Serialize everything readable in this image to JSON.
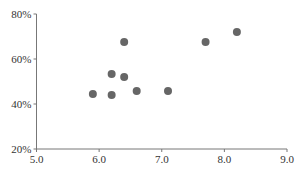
{
  "chart_data": {
    "type": "scatter",
    "title": "",
    "xlabel": "",
    "ylabel": "",
    "xlim": [
      5.0,
      9.0
    ],
    "ylim": [
      20,
      80
    ],
    "x_ticks": [
      "5.0",
      "6.0",
      "7.0",
      "8.0",
      "9.0"
    ],
    "y_ticks": [
      "20%",
      "40%",
      "60%",
      "80%"
    ],
    "grid": false,
    "legend": null,
    "point_color": "#666666",
    "series": [
      {
        "name": "points",
        "x": [
          5.9,
          6.2,
          6.2,
          6.4,
          6.4,
          6.6,
          7.1,
          7.7,
          8.2
        ],
        "y": [
          44.4,
          44.0,
          53.3,
          52.0,
          67.6,
          45.8,
          45.8,
          67.6,
          72.0
        ]
      }
    ]
  }
}
